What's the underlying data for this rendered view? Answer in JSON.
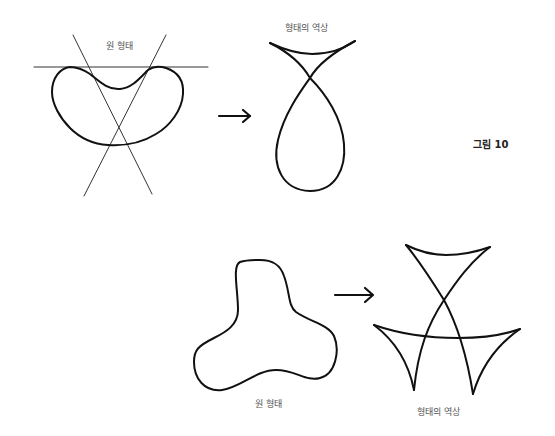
{
  "figure": {
    "label": "그림 10"
  },
  "top_example": {
    "original_label": "원 형태",
    "inverse_label": "형태의 역상",
    "original_shape": "kidney-shape-with-bitangent-lines",
    "inverse_shape": "swallowtail-loop",
    "arrow": "right-arrow"
  },
  "bottom_example": {
    "original_label": "원 형태",
    "inverse_label": "형태의 역상",
    "original_shape": "three-lobed-shape",
    "inverse_shape": "triple-cusp-wavefront",
    "arrow": "right-arrow"
  },
  "colors": {
    "ink": "#111111",
    "label_text": "#555555",
    "background": "#ffffff"
  }
}
